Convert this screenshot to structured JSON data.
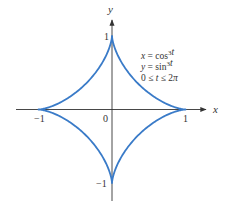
{
  "chart_data": {
    "type": "line",
    "title": "",
    "xlabel": "x",
    "ylabel": "y",
    "series": [
      {
        "name": "astroid",
        "parametric": {
          "x": "cos^3 t",
          "y": "sin^3 t",
          "t_range": [
            0,
            6.283185307179586
          ]
        },
        "color": "#3a7bc8"
      }
    ],
    "equations": [
      "x = cos³t",
      "y = sin³t",
      "0 ≤ t ≤ 2π"
    ],
    "x_ticks": [
      {
        "value": -1,
        "label": "−1"
      },
      {
        "value": 1,
        "label": "1"
      }
    ],
    "y_ticks": [
      {
        "value": 1,
        "label": "1"
      },
      {
        "value": -1,
        "label": "−1"
      }
    ],
    "origin_label": "0",
    "xlim": [
      -1.3,
      1.3
    ],
    "ylim": [
      -1.3,
      1.3
    ],
    "grid": false,
    "legend": "none"
  },
  "layout": {
    "cx": 112,
    "cy": 109.5,
    "radius": 73.5,
    "x_axis": {
      "x1": 16,
      "x2": 206
    },
    "y_axis": {
      "y1": 20,
      "y2": 201
    }
  }
}
